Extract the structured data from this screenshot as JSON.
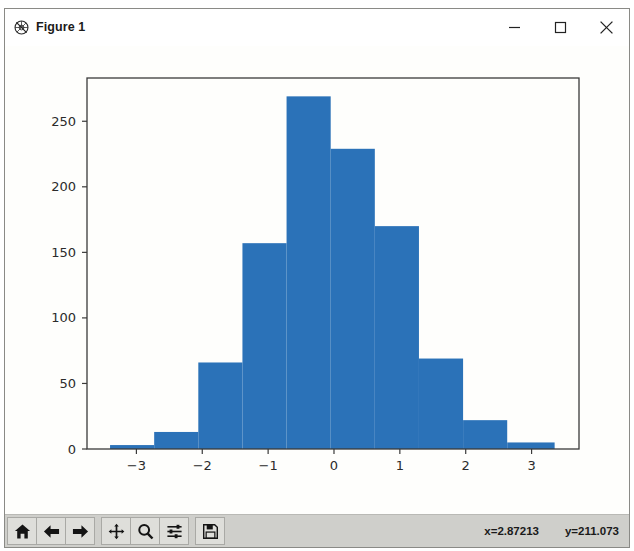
{
  "window": {
    "title": "Figure 1",
    "icon": "matplotlib-logo-icon",
    "minimize_label": "–",
    "maximize_label": "□",
    "close_label": "×"
  },
  "toolbar": {
    "buttons": [
      {
        "name": "home-icon",
        "tooltip": "Reset original view"
      },
      {
        "name": "back-arrow-icon",
        "tooltip": "Back to previous view"
      },
      {
        "name": "forward-arrow-icon",
        "tooltip": "Forward to next view"
      },
      {
        "name": "pan-move-icon",
        "tooltip": "Pan axes with left mouse, zoom with right"
      },
      {
        "name": "zoom-magnifier-icon",
        "tooltip": "Zoom to rectangle"
      },
      {
        "name": "configure-subplots-icon",
        "tooltip": "Configure subplots"
      },
      {
        "name": "save-floppy-icon",
        "tooltip": "Save the figure"
      }
    ],
    "coord_x": "x=2.87213",
    "coord_y": "y=211.073"
  },
  "colors": {
    "bar_fill": "#2b72b8",
    "axis_line": "#3a3a3a",
    "canvas_bg": "#fefefc",
    "toolbar_bg": "#cfcfcb",
    "tick_text": "#2b2b2b"
  },
  "chart_data": {
    "type": "bar",
    "title": "",
    "xlabel": "",
    "ylabel": "",
    "xlim": [
      -3.75,
      3.72
    ],
    "ylim": [
      0,
      283
    ],
    "xticks": [
      -3,
      -2,
      -1,
      0,
      1,
      2,
      3
    ],
    "xtick_labels": [
      "−3",
      "−2",
      "−1",
      "0",
      "1",
      "2",
      "3"
    ],
    "yticks": [
      0,
      50,
      100,
      150,
      200,
      250
    ],
    "ytick_labels": [
      "0",
      "50",
      "100",
      "150",
      "200",
      "250"
    ],
    "grid": false,
    "legend": null,
    "bin_edges": [
      -3.4,
      -2.73,
      -2.06,
      -1.39,
      -0.72,
      -0.05,
      0.62,
      1.29,
      1.96,
      2.63,
      3.35
    ],
    "categories": [
      "-3.40 to -2.73",
      "-2.73 to -2.06",
      "-2.06 to -1.39",
      "-1.39 to -0.72",
      "-0.72 to -0.05",
      "-0.05 to 0.62",
      "0.62 to 1.29",
      "1.29 to 1.96",
      "1.96 to 2.63",
      "2.63 to 3.35"
    ],
    "values": [
      3,
      13,
      66,
      157,
      269,
      229,
      170,
      69,
      22,
      5
    ]
  }
}
